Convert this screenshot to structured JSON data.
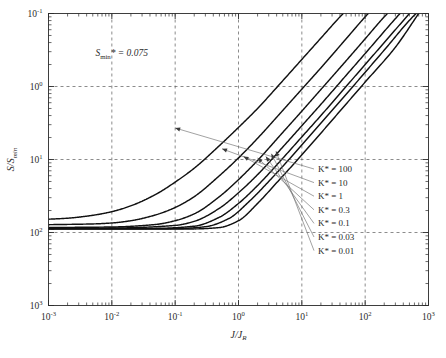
{
  "chart_data": {
    "type": "line",
    "title": "",
    "xlabel": "J/J_R",
    "ylabel": "S/S_min",
    "xlabel_parts": {
      "num": "J",
      "den": "J",
      "den_sub": "R"
    },
    "ylabel_parts": {
      "num": "S",
      "den": "S",
      "den_sub": "min"
    },
    "xscale": "log",
    "yscale": "log",
    "xlim": [
      0.001,
      1000
    ],
    "ylim": [
      0.1,
      1000
    ],
    "grid": true,
    "grid_style": "dashed major decades",
    "legend_position": "inside-right",
    "x_tick_labels": [
      "10-3",
      "10-2",
      "10-1",
      "100",
      "101",
      "102",
      "103"
    ],
    "x_tick_values": [
      0.001,
      0.01,
      0.1,
      1,
      10,
      100,
      1000
    ],
    "y_tick_labels": [
      "10-1",
      "100",
      "101",
      "102",
      "103"
    ],
    "y_tick_values": [
      0.1,
      1,
      10,
      100,
      1000
    ],
    "annotations": [
      {
        "name": "s-min-star-annotation",
        "text": "S_min* = 0.075",
        "text_prefix": "S",
        "text_sub": "min",
        "text_suffix": "* = 0.075",
        "x": 0.0055,
        "y": 260
      }
    ],
    "series": [
      {
        "name": "K* = 100",
        "label": "K* = 100",
        "marker_x": 0.1,
        "marker_y": 27,
        "points": [
          [
            0.001,
            1.52
          ],
          [
            0.002,
            1.57
          ],
          [
            0.005,
            1.72
          ],
          [
            0.01,
            1.93
          ],
          [
            0.02,
            2.32
          ],
          [
            0.05,
            3.35
          ],
          [
            0.1,
            4.9
          ],
          [
            0.2,
            7.6
          ],
          [
            0.5,
            15.5
          ],
          [
            1.0,
            27.5
          ],
          [
            2.0,
            50
          ],
          [
            5.0,
            120
          ],
          [
            10.0,
            235
          ],
          [
            20.0,
            460
          ],
          [
            40.0,
            900
          ],
          [
            45.0,
            1000
          ]
        ]
      },
      {
        "name": "K* = 10",
        "label": "K* = 10",
        "marker_x": 0.55,
        "marker_y": 14,
        "points": [
          [
            0.001,
            1.28
          ],
          [
            0.005,
            1.31
          ],
          [
            0.01,
            1.35
          ],
          [
            0.02,
            1.45
          ],
          [
            0.05,
            1.75
          ],
          [
            0.1,
            2.2
          ],
          [
            0.2,
            3.1
          ],
          [
            0.5,
            6.0
          ],
          [
            1.0,
            10.5
          ],
          [
            2.0,
            19.5
          ],
          [
            5.0,
            47
          ],
          [
            10.0,
            92
          ],
          [
            20.0,
            180
          ],
          [
            50.0,
            450
          ],
          [
            100.0,
            900
          ],
          [
            112.0,
            1000
          ]
        ]
      },
      {
        "name": "K* = 1",
        "label": "K* = 1",
        "marker_x": 1.2,
        "marker_y": 11,
        "points": [
          [
            0.001,
            1.17
          ],
          [
            0.01,
            1.19
          ],
          [
            0.05,
            1.29
          ],
          [
            0.1,
            1.45
          ],
          [
            0.2,
            1.8
          ],
          [
            0.5,
            3.1
          ],
          [
            1.0,
            5.3
          ],
          [
            2.0,
            9.7
          ],
          [
            5.0,
            23.5
          ],
          [
            10.0,
            46
          ],
          [
            20.0,
            91
          ],
          [
            50.0,
            225
          ],
          [
            100.0,
            450
          ],
          [
            200.0,
            900
          ],
          [
            225.0,
            1000
          ]
        ]
      },
      {
        "name": "K* = 0.3",
        "label": "K* = 0.3",
        "marker_x": 2.0,
        "marker_y": 10.5,
        "points": [
          [
            0.001,
            1.14
          ],
          [
            0.01,
            1.15
          ],
          [
            0.1,
            1.25
          ],
          [
            0.2,
            1.42
          ],
          [
            0.5,
            2.15
          ],
          [
            1.0,
            3.5
          ],
          [
            2.0,
            6.2
          ],
          [
            5.0,
            14.8
          ],
          [
            10.0,
            29
          ],
          [
            20.0,
            57
          ],
          [
            50.0,
            142
          ],
          [
            100.0,
            283
          ],
          [
            300.0,
            850
          ],
          [
            355.0,
            1000
          ]
        ]
      },
      {
        "name": "K* = 0.1",
        "label": "K* = 0.1",
        "marker_x": 2.7,
        "marker_y": 11,
        "points": [
          [
            0.001,
            1.13
          ],
          [
            0.05,
            1.14
          ],
          [
            0.2,
            1.22
          ],
          [
            0.5,
            1.62
          ],
          [
            1.0,
            2.5
          ],
          [
            2.0,
            4.4
          ],
          [
            5.0,
            10.4
          ],
          [
            10.0,
            20.4
          ],
          [
            20.0,
            40
          ],
          [
            50.0,
            100
          ],
          [
            100.0,
            200
          ],
          [
            400.0,
            800
          ],
          [
            500.0,
            1000
          ]
        ]
      },
      {
        "name": "K* = 0.03",
        "label": "K* = 0.03",
        "marker_x": 3.3,
        "marker_y": 12,
        "points": [
          [
            0.001,
            1.12
          ],
          [
            0.1,
            1.13
          ],
          [
            0.3,
            1.2
          ],
          [
            0.7,
            1.55
          ],
          [
            1.5,
            2.7
          ],
          [
            3.0,
            5.0
          ],
          [
            6.0,
            9.6
          ],
          [
            12.0,
            19
          ],
          [
            30.0,
            47
          ],
          [
            80.0,
            125
          ],
          [
            200.0,
            315
          ],
          [
            600.0,
            950
          ],
          [
            640.0,
            1000
          ]
        ]
      },
      {
        "name": "K* = 0.01",
        "label": "K* = 0.01",
        "marker_x": 3.9,
        "marker_y": 13,
        "points": [
          [
            0.001,
            1.115
          ],
          [
            0.2,
            1.12
          ],
          [
            0.5,
            1.17
          ],
          [
            1.0,
            1.45
          ],
          [
            2.0,
            2.5
          ],
          [
            4.0,
            4.8
          ],
          [
            8.0,
            9.3
          ],
          [
            16.0,
            18.4
          ],
          [
            40.0,
            46
          ],
          [
            100.0,
            115
          ],
          [
            300.0,
            345
          ],
          [
            700.0,
            1000
          ]
        ]
      }
    ]
  },
  "legend": {
    "items": [
      {
        "label": "K* = 100"
      },
      {
        "label": "K* = 10"
      },
      {
        "label": "K* = 1"
      },
      {
        "label": "K* = 0.3"
      },
      {
        "label": "K* = 0.1"
      },
      {
        "label": "K* = 0.03"
      },
      {
        "label": "K* = 0.01"
      }
    ]
  },
  "axes": {
    "x": {
      "ticks": [
        {
          "label_base": "10",
          "label_exp": "-3"
        },
        {
          "label_base": "10",
          "label_exp": "-2"
        },
        {
          "label_base": "10",
          "label_exp": "-1"
        },
        {
          "label_base": "10",
          "label_exp": "0"
        },
        {
          "label_base": "10",
          "label_exp": "1"
        },
        {
          "label_base": "10",
          "label_exp": "2"
        },
        {
          "label_base": "10",
          "label_exp": "3"
        }
      ]
    },
    "y": {
      "ticks": [
        {
          "label_base": "10",
          "label_exp": "3"
        },
        {
          "label_base": "10",
          "label_exp": "2"
        },
        {
          "label_base": "10",
          "label_exp": "1"
        },
        {
          "label_base": "10",
          "label_exp": "0"
        },
        {
          "label_base": "10",
          "label_exp": "-1"
        }
      ]
    }
  }
}
